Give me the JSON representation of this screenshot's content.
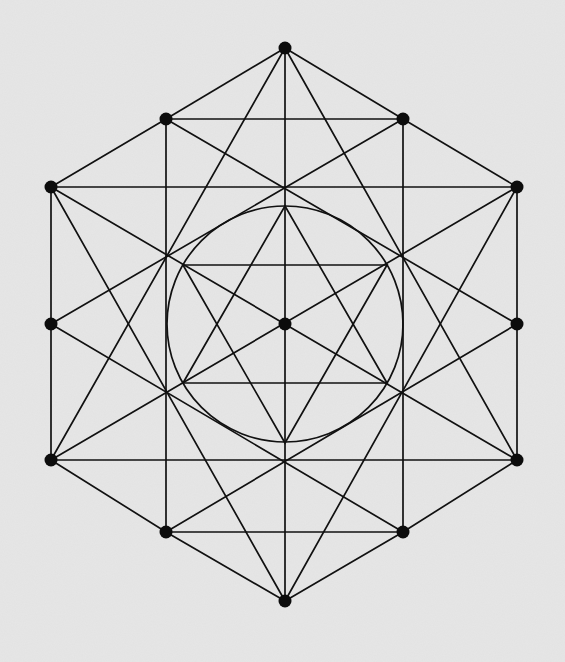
{
  "diagram": {
    "title": "",
    "background": "#e2e2e2",
    "stroke_color": "#111111",
    "vertices": [
      {
        "id": "top",
        "x": 285,
        "y": 48
      },
      {
        "id": "upper-left",
        "x": 166,
        "y": 119
      },
      {
        "id": "upper-right",
        "x": 403,
        "y": 119
      },
      {
        "id": "outer-upper-left",
        "x": 51,
        "y": 187
      },
      {
        "id": "outer-upper-right",
        "x": 517,
        "y": 187
      },
      {
        "id": "middle-left",
        "x": 51,
        "y": 324
      },
      {
        "id": "middle-right",
        "x": 517,
        "y": 324
      },
      {
        "id": "outer-lower-left",
        "x": 51,
        "y": 460
      },
      {
        "id": "outer-lower-right",
        "x": 517,
        "y": 460
      },
      {
        "id": "lower-left",
        "x": 166,
        "y": 532
      },
      {
        "id": "lower-right",
        "x": 403,
        "y": 532
      },
      {
        "id": "bottom",
        "x": 285,
        "y": 601
      },
      {
        "id": "center",
        "x": 285,
        "y": 324
      }
    ],
    "edges": [
      [
        "top",
        "upper-left"
      ],
      [
        "upper-left",
        "outer-upper-left"
      ],
      [
        "outer-upper-left",
        "middle-left"
      ],
      [
        "middle-left",
        "outer-lower-left"
      ],
      [
        "outer-lower-left",
        "lower-left"
      ],
      [
        "lower-left",
        "bottom"
      ],
      [
        "top",
        "upper-right"
      ],
      [
        "upper-right",
        "outer-upper-right"
      ],
      [
        "outer-upper-right",
        "middle-right"
      ],
      [
        "middle-right",
        "outer-lower-right"
      ],
      [
        "outer-lower-right",
        "lower-right"
      ],
      [
        "lower-right",
        "bottom"
      ],
      [
        "upper-left",
        "upper-right"
      ],
      [
        "outer-upper-left",
        "outer-upper-right"
      ],
      [
        "outer-lower-left",
        "outer-lower-right"
      ],
      [
        "lower-left",
        "lower-right"
      ],
      [
        "upper-left",
        "lower-left"
      ],
      [
        "upper-right",
        "lower-right"
      ],
      [
        "top",
        "bottom"
      ],
      [
        "middle-left",
        "upper-right"
      ],
      [
        "middle-left",
        "lower-right"
      ],
      [
        "middle-right",
        "upper-left"
      ],
      [
        "middle-right",
        "lower-left"
      ],
      [
        "outer-upper-left",
        "outer-lower-right"
      ],
      [
        "outer-lower-left",
        "outer-upper-right"
      ],
      [
        "outer-upper-left",
        "bottom"
      ],
      [
        "outer-upper-right",
        "bottom"
      ],
      [
        "outer-lower-left",
        "top"
      ],
      [
        "outer-lower-right",
        "top"
      ]
    ],
    "inner_circle": {
      "cx": 285,
      "cy": 324,
      "r": 118
    },
    "inner_hexagram": {
      "triangle_up": [
        [
          285,
          206
        ],
        [
          183,
          383
        ],
        [
          387,
          383
        ]
      ],
      "triangle_down": [
        [
          285,
          443
        ],
        [
          183,
          265
        ],
        [
          387,
          265
        ]
      ]
    },
    "labels": []
  }
}
